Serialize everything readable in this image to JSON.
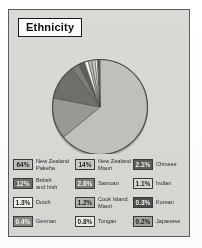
{
  "figure": {
    "title": "Ethnicity",
    "background_color": "#d9d9d6",
    "frame_color": "#5c5c5c"
  },
  "chart_data": {
    "type": "pie",
    "title": "Ethnicity",
    "xlabel": "",
    "ylabel": "",
    "legend_position": "bottom",
    "grid": false,
    "categories": [
      "New Zealand Pakeha",
      "New Zealand Maori",
      "Chinese",
      "British and Irish",
      "Samoan",
      "Indian",
      "Dutch",
      "Cook Island Maori",
      "Korean",
      "German",
      "Tongan",
      "Japanese"
    ],
    "values": [
      64,
      14,
      2.1,
      12,
      2.6,
      1.1,
      1.3,
      1.2,
      0.3,
      0.4,
      0.8,
      0.2
    ],
    "value_labels": [
      "64%",
      "14%",
      "2.1%",
      "12%",
      "2.6%",
      "1.1%",
      "1.3%",
      "1.2%",
      "0.3%",
      "0.4%",
      "0.8%",
      "0.2%"
    ],
    "colors": [
      "#c2c2bd",
      "#9a9a95",
      "#5e5e5a",
      "#6f6f6b",
      "#7d7d79",
      "#cfcfca",
      "#f2f2ee",
      "#b5b5b0",
      "#4f4f4c",
      "#8a8a86",
      "#efefea",
      "#a6a6a1"
    ],
    "slices": [
      {
        "label": "New Zealand Pakeha",
        "value": 64,
        "value_label": "64%",
        "color": "#c2c2bd"
      },
      {
        "label": "New Zealand Maori",
        "value": 14,
        "value_label": "14%",
        "color": "#9a9a95"
      },
      {
        "label": "British and Irish",
        "value": 12,
        "value_label": "12%",
        "color": "#6f6f6b"
      },
      {
        "label": "Samoan",
        "value": 2.6,
        "value_label": "2.6%",
        "color": "#7d7d79"
      },
      {
        "label": "Chinese",
        "value": 2.1,
        "value_label": "2.1%",
        "color": "#5e5e5a"
      },
      {
        "label": "Dutch",
        "value": 1.3,
        "value_label": "1.3%",
        "color": "#f2f2ee"
      },
      {
        "label": "Cook Island Maori",
        "value": 1.2,
        "value_label": "1.2%",
        "color": "#b5b5b0"
      },
      {
        "label": "Indian",
        "value": 1.1,
        "value_label": "1.1%",
        "color": "#cfcfca"
      },
      {
        "label": "Tongan",
        "value": 0.8,
        "value_label": "0.8%",
        "color": "#efefea"
      },
      {
        "label": "German",
        "value": 0.4,
        "value_label": "0.4%",
        "color": "#8a8a86"
      },
      {
        "label": "Korean",
        "value": 0.3,
        "value_label": "0.3%",
        "color": "#4f4f4c"
      },
      {
        "label": "Japanese",
        "value": 0.2,
        "value_label": "0.2%",
        "color": "#a6a6a1"
      }
    ]
  },
  "legend": {
    "columns": [
      {
        "items": [
          {
            "value": "64%",
            "label": "New Zealand\nPakeha",
            "swatch": "#c2c2bd",
            "text_color": "#1d1d1d"
          },
          {
            "value": "12%",
            "label": "British\nand Irish",
            "swatch": "#6f6f6b",
            "text_color": "#f4f4f0"
          },
          {
            "value": "1.3%",
            "label": "Dutch",
            "swatch": "#f2f2ee",
            "text_color": "#1d1d1d"
          },
          {
            "value": "0.4%",
            "label": "German",
            "swatch": "#8a8a86",
            "text_color": "#f4f4f0"
          }
        ]
      },
      {
        "items": [
          {
            "value": "14%",
            "label": "New Zealand\nMaori",
            "swatch": "#cdcdc8",
            "text_color": "#1d1d1d"
          },
          {
            "value": "2.6%",
            "label": "Samoan",
            "swatch": "#7d7d79",
            "text_color": "#f4f4f0"
          },
          {
            "value": "1.2%",
            "label": "Cook Island\nMaori",
            "swatch": "#b5b5b0",
            "text_color": "#1d1d1d"
          },
          {
            "value": "0.8%",
            "label": "Tongan",
            "swatch": "#efefea",
            "text_color": "#1d1d1d"
          }
        ]
      },
      {
        "items": [
          {
            "value": "2.1%",
            "label": "Chinese",
            "swatch": "#5e5e5a",
            "text_color": "#f4f4f0"
          },
          {
            "value": "1.1%",
            "label": "Indian",
            "swatch": "#dcdcd7",
            "text_color": "#1d1d1d"
          },
          {
            "value": "0.3%",
            "label": "Korean",
            "swatch": "#4f4f4c",
            "text_color": "#f4f4f0"
          },
          {
            "value": "0.2%",
            "label": "Japanese",
            "swatch": "#a6a6a1",
            "text_color": "#1d1d1d"
          }
        ]
      }
    ]
  }
}
